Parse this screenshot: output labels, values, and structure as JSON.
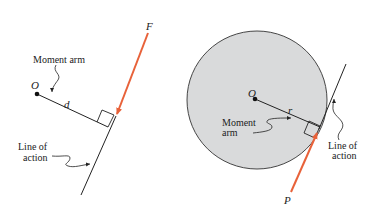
{
  "colors": {
    "force": "#e8623a",
    "line": "#222222",
    "circle_fill": "#d9dadb",
    "background": "#ffffff"
  },
  "left_figure": {
    "force_label": "F",
    "point_label": "O",
    "distance_label": "d",
    "moment_arm_label": "Moment arm",
    "line_of_action_label_1": "Line of",
    "line_of_action_label_2": "action"
  },
  "right_figure": {
    "force_label": "P",
    "point_label": "O",
    "radius_label": "r",
    "moment_arm_label_1": "Moment",
    "moment_arm_label_2": "arm",
    "line_of_action_label_1": "Line of",
    "line_of_action_label_2": "action"
  }
}
